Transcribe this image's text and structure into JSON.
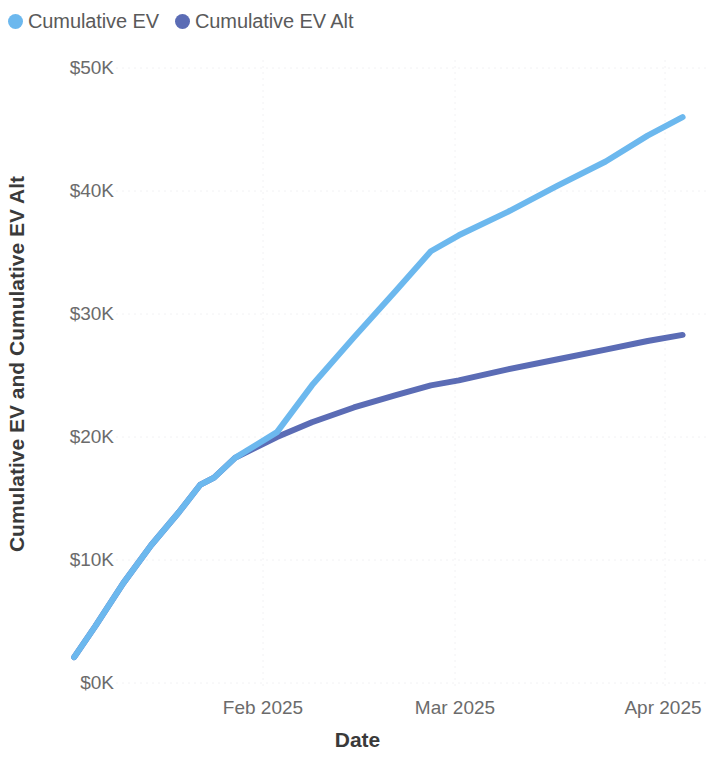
{
  "legend": {
    "position": "top-left",
    "items": [
      {
        "label": "Cumulative EV",
        "color": "#6cb8ee",
        "marker": "circle-dot-icon"
      },
      {
        "label": "Cumulative EV Alt",
        "color": "#5b6cb5",
        "marker": "circle-dot-icon"
      }
    ]
  },
  "axes": {
    "y_title": "Cumulative EV and Cumulative EV Alt",
    "x_title": "Date",
    "y_ticks": [
      "$0K",
      "$10K",
      "$20K",
      "$30K",
      "$40K",
      "$50K"
    ],
    "x_ticks": [
      "Feb 2025",
      "Mar 2025",
      "Apr 2025"
    ]
  },
  "chart_data": {
    "type": "line",
    "title": "",
    "subtitle": "",
    "xlabel": "Date",
    "ylabel": "Cumulative EV and Cumulative EV Alt",
    "grid": true,
    "legend_position": "top-left",
    "xlim": [
      "2025-01-04",
      "2025-04-03"
    ],
    "ylim": [
      0,
      50000
    ],
    "ytick_values": [
      0,
      10000,
      20000,
      30000,
      40000,
      50000
    ],
    "ytick_labels": [
      "$0K",
      "$10K",
      "$20K",
      "$30K",
      "$40K",
      "$50K"
    ],
    "xtick_values": [
      "2025-02-01",
      "2025-03-01",
      "2025-04-01"
    ],
    "xtick_labels": [
      "Feb 2025",
      "Mar 2025",
      "Apr 2025"
    ],
    "y_tick_format": "$#K",
    "series": [
      {
        "name": "Cumulative EV",
        "color": "#6cb8ee",
        "x": [
          "2025-01-05",
          "2025-01-08",
          "2025-01-12",
          "2025-01-16",
          "2025-01-20",
          "2025-01-23",
          "2025-01-25",
          "2025-01-28",
          "2025-02-03",
          "2025-02-08",
          "2025-02-14",
          "2025-02-20",
          "2025-02-25",
          "2025-03-01",
          "2025-03-08",
          "2025-03-15",
          "2025-03-22",
          "2025-03-28",
          "2025-04-02"
        ],
        "values": [
          2100,
          4600,
          8100,
          11200,
          13900,
          16100,
          16700,
          18300,
          20400,
          24200,
          28100,
          31900,
          35100,
          36400,
          38300,
          40400,
          42400,
          44500,
          46000
        ]
      },
      {
        "name": "Cumulative EV Alt",
        "color": "#5b6cb5",
        "x": [
          "2025-01-05",
          "2025-01-08",
          "2025-01-12",
          "2025-01-16",
          "2025-01-20",
          "2025-01-23",
          "2025-01-25",
          "2025-01-28",
          "2025-02-03",
          "2025-02-08",
          "2025-02-14",
          "2025-02-20",
          "2025-02-25",
          "2025-03-01",
          "2025-03-08",
          "2025-03-15",
          "2025-03-22",
          "2025-03-28",
          "2025-04-02"
        ],
        "values": [
          2100,
          4600,
          8100,
          11200,
          13900,
          16100,
          16700,
          18300,
          20000,
          21200,
          22400,
          23400,
          24200,
          24600,
          25500,
          26300,
          27100,
          27800,
          28300
        ]
      }
    ],
    "annotations": [
      {
        "text": "Series diverge just before Feb 2025 at about $20K",
        "x": "2025-02-01",
        "y": 20000
      }
    ]
  }
}
